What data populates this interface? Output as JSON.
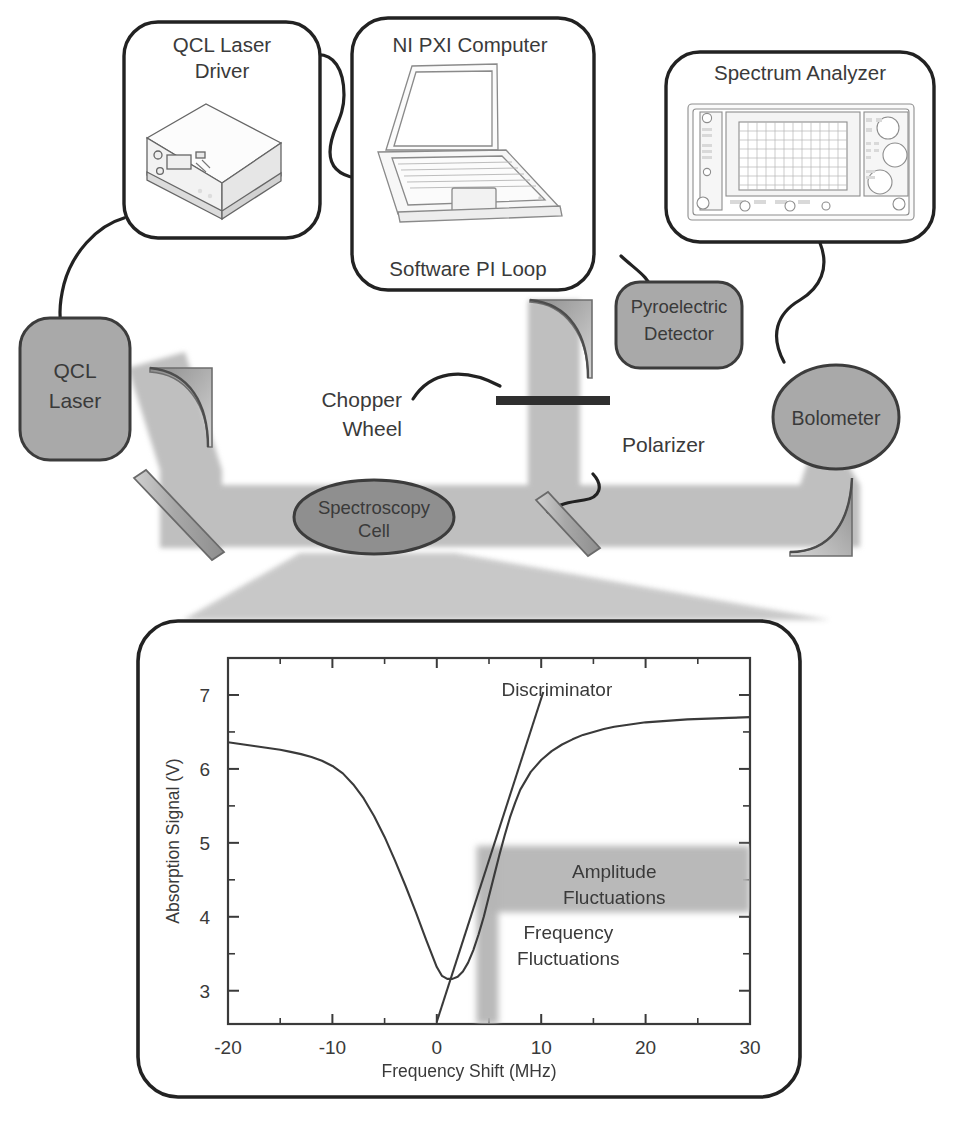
{
  "figure": {
    "instrument_boxes": [
      {
        "id": "qcl-laser-driver",
        "label_line1": "QCL Laser",
        "label_line2": "Driver",
        "icon": "benchtop-laser-driver-icon"
      },
      {
        "id": "ni-pxi-computer",
        "label_line1": "NI PXI Computer",
        "label_line2": "Software PI Loop",
        "icon": "laptop-computer-icon"
      },
      {
        "id": "spectrum-analyzer",
        "label_line1": "Spectrum Analyzer",
        "label_line2": "",
        "icon": "spectrum-analyzer-front-panel-icon"
      }
    ],
    "optical_components": [
      {
        "id": "qcl-laser",
        "label_line1": "QCL",
        "label_line2": "Laser",
        "shape": "rounded-rect"
      },
      {
        "id": "pyroelectric-detector",
        "label_line1": "Pyroelectric",
        "label_line2": "Detector",
        "shape": "rounded-rect"
      },
      {
        "id": "bolometer",
        "label_line1": "Bolometer",
        "label_line2": "",
        "shape": "ellipse"
      },
      {
        "id": "spectroscopy-cell",
        "label_line1": "Spectroscopy",
        "label_line2": "Cell",
        "shape": "ellipse"
      }
    ],
    "callout_labels": [
      {
        "id": "chopper-wheel",
        "line1": "Chopper",
        "line2": "Wheel"
      },
      {
        "id": "polarizer",
        "line1": "Polarizer",
        "line2": ""
      }
    ],
    "colors": {
      "component_fill": "#a9a9a9",
      "component_stroke": "#3c3c3c",
      "cell_fill": "#8f8f8f",
      "beam": "#bdbdbd",
      "box_stroke": "#222222",
      "band": "#b5b5b5",
      "text": "#3a3a3a",
      "curve": "#3a3a3a"
    }
  },
  "chart_data": {
    "type": "line",
    "title": "",
    "xlabel": "Frequency Shift (MHz)",
    "ylabel": "Absorption Signal (V)",
    "xlim": [
      -20,
      30
    ],
    "ylim": [
      2.55,
      7.5
    ],
    "xticks": [
      -20,
      -10,
      0,
      10,
      20,
      30
    ],
    "xtick_labels": [
      "-20",
      "-10",
      "0",
      "10",
      "20",
      "30"
    ],
    "x_minor_ticks": [
      -15,
      -5,
      5,
      15,
      25
    ],
    "yticks": [
      3,
      4,
      5,
      6,
      7
    ],
    "ytick_labels": [
      "3",
      "4",
      "5",
      "6",
      "7"
    ],
    "y_minor_ticks": [
      3.5,
      4.5,
      5.5,
      6.5,
      7.5
    ],
    "grid": false,
    "legend": null,
    "series": [
      {
        "name": "Absorption Signal",
        "x": [
          -20,
          -19,
          -18,
          -17,
          -16,
          -15,
          -14,
          -13,
          -12,
          -11,
          -10,
          -9,
          -8,
          -7,
          -6,
          -5,
          -4,
          -3,
          -2,
          -1,
          0,
          0.5,
          1,
          1.5,
          2,
          2.5,
          3,
          3.5,
          4,
          4.5,
          5,
          5.5,
          6,
          6.5,
          7,
          7.5,
          8,
          9,
          10,
          11,
          12,
          13,
          14,
          15,
          16,
          17,
          18,
          19,
          20,
          22,
          24,
          26,
          28,
          30
        ],
        "y": [
          6.36,
          6.34,
          6.32,
          6.3,
          6.28,
          6.26,
          6.23,
          6.2,
          6.16,
          6.11,
          6.04,
          5.94,
          5.79,
          5.6,
          5.36,
          5.08,
          4.76,
          4.42,
          4.06,
          3.68,
          3.32,
          3.2,
          3.16,
          3.16,
          3.19,
          3.26,
          3.38,
          3.55,
          3.76,
          4.0,
          4.28,
          4.56,
          4.84,
          5.1,
          5.34,
          5.54,
          5.72,
          5.96,
          6.12,
          6.24,
          6.33,
          6.4,
          6.46,
          6.5,
          6.54,
          6.57,
          6.59,
          6.61,
          6.63,
          6.65,
          6.67,
          6.68,
          6.69,
          6.7
        ]
      },
      {
        "name": "Discriminator",
        "x": [
          0.0,
          10.2
        ],
        "y": [
          2.58,
          7.04
        ]
      }
    ],
    "annotations": [
      {
        "id": "discriminator",
        "text": "Discriminator",
        "x": 11.5,
        "y": 6.98
      },
      {
        "id": "amplitude-fluctuations",
        "line1": "Amplitude",
        "line2": "Fluctuations",
        "x": 17.0,
        "y": 4.52
      },
      {
        "id": "frequency-fluctuations",
        "line1": "Frequency",
        "line2": "Fluctuations",
        "x": 12.6,
        "y": 3.7
      }
    ],
    "shaded_bands": [
      {
        "id": "amplitude-band",
        "orientation": "horizontal",
        "y_range": [
          4.06,
          4.96
        ],
        "x_range": [
          5.0,
          30.0
        ]
      },
      {
        "id": "frequency-band",
        "orientation": "vertical",
        "x_range": [
          3.8,
          5.9
        ],
        "y_range": [
          2.55,
          4.96
        ]
      }
    ]
  }
}
